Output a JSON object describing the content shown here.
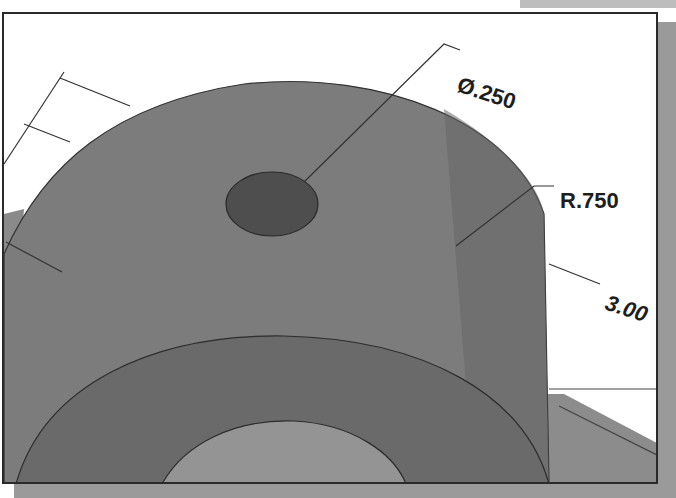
{
  "figure": {
    "colors": {
      "body_main": "#7c7c7c",
      "body_dark": "#5e5e5e",
      "hole": "#4a4a4a",
      "inner_arc": "#949494",
      "background": "#ffffff",
      "frame": "#2a2a2a",
      "shadow": "#9a9a9a"
    }
  },
  "dimensions": {
    "hole_diameter": "Ø.250",
    "radius": "R.750",
    "length": "3.00"
  }
}
